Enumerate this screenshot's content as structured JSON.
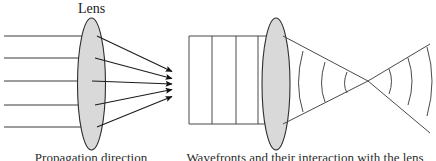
{
  "figure": {
    "width": 436,
    "height": 161,
    "background_color": "#ffffff",
    "title": "",
    "panels": [
      {
        "id": "ray-optics-panel",
        "name": "Ray optics: parallel rays focused by a lens",
        "label": "Lens",
        "caption": "Propagation direction",
        "lens": {
          "center_x": 91.5,
          "center_y": 84,
          "rx": 14,
          "ry": 66,
          "fill": "#d9d9d9",
          "stroke": "#2e2e2e"
        },
        "focus": {
          "x": 175,
          "y": 84
        },
        "incoming_rays": [
          {
            "y": 36,
            "x_start": 4,
            "x_end": 97
          },
          {
            "y": 58,
            "x_start": 4,
            "x_end": 95
          },
          {
            "y": 81,
            "x_start": 4,
            "x_end": 92
          },
          {
            "y": 105,
            "x_start": 4,
            "x_end": 95
          },
          {
            "y": 127,
            "x_start": 4,
            "x_end": 97
          }
        ],
        "converging_rays": [
          {
            "x1": 97,
            "y1": 36,
            "x2": 174,
            "y2": 72
          },
          {
            "x1": 95,
            "y1": 58,
            "x2": 174,
            "y2": 79
          },
          {
            "x1": 92,
            "y1": 81,
            "x2": 174,
            "y2": 84
          },
          {
            "x1": 95,
            "y1": 105,
            "x2": 174,
            "y2": 89
          },
          {
            "x1": 97,
            "y1": 127,
            "x2": 174,
            "y2": 96
          }
        ],
        "arrowheads": 5
      },
      {
        "id": "wavefront-optics-panel",
        "name": "Wave optics: plane wavefronts focused by a lens",
        "label": "",
        "caption": "Wavefronts and their interaction with the lens",
        "lens": {
          "center_x": 276,
          "center_y": 84,
          "rx": 14,
          "ry": 66,
          "fill": "#d9d9d9",
          "stroke": "#2e2e2e"
        },
        "focus": {
          "x": 368,
          "y": 81
        },
        "beam_top_y": 36,
        "beam_bottom_y": 124,
        "beam_x_start": 189,
        "plane_wavefronts_x": [
          189,
          212,
          236,
          258
        ],
        "converging_arcs": 3,
        "diverging_arcs": 3
      }
    ],
    "colors": {
      "ray": "#3a3a3a",
      "ray_dark": "#1c1c1c",
      "wavefront": "#4a4a4a",
      "lens_fill": "#d9d9d9",
      "lens_stroke": "#2e2e2e",
      "text": "#1a1a1a"
    }
  }
}
